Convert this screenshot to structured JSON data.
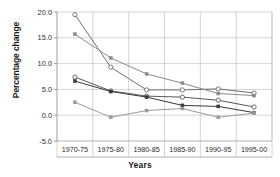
{
  "chart_data": {
    "type": "line",
    "title": "",
    "xlabel": "Years",
    "ylabel": "Percentage change",
    "categories": [
      "1970-75",
      "1975-80",
      "1980-85",
      "1985-90",
      "1990-95",
      "1995-00"
    ],
    "ylim": [
      -5.0,
      20.0
    ],
    "yticks": [
      "20.0",
      "15.0",
      "10.0",
      "5.0",
      "0.0",
      "-5.0"
    ],
    "ytick_values": [
      20.0,
      15.0,
      10.0,
      5.0,
      0.0,
      -5.0
    ],
    "grid": true,
    "legend": "none",
    "series": [
      {
        "name": "series-1",
        "marker": "open-circle",
        "color": "#6e6e6e",
        "values": [
          19.5,
          9.3,
          4.9,
          4.9,
          5.1,
          4.3
        ]
      },
      {
        "name": "series-2",
        "marker": "filled-square",
        "color": "#8a8a8a",
        "values": [
          15.7,
          11.1,
          8.0,
          6.2,
          4.2,
          3.8
        ]
      },
      {
        "name": "series-3",
        "marker": "open-circle",
        "color": "#5a5a5a",
        "values": [
          7.4,
          4.7,
          3.7,
          3.5,
          2.9,
          1.6
        ]
      },
      {
        "name": "series-4",
        "marker": "filled-square",
        "color": "#3a3a3a",
        "values": [
          6.6,
          4.6,
          3.5,
          1.9,
          1.7,
          0.5
        ]
      },
      {
        "name": "series-5",
        "marker": "filled-square",
        "color": "#9a9a9a",
        "values": [
          2.5,
          -0.4,
          0.9,
          1.3,
          -0.4,
          0.4
        ]
      }
    ]
  }
}
